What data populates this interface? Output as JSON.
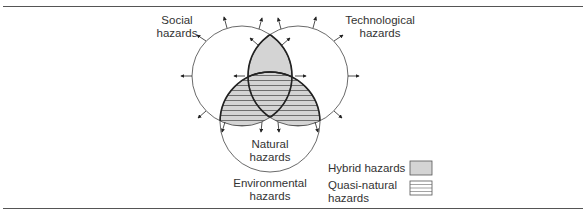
{
  "diagram": {
    "type": "venn",
    "sets": [
      {
        "id": "social",
        "label_line1": "Social",
        "label_line2": "hazards"
      },
      {
        "id": "technological",
        "label_line1": "Technological",
        "label_line2": "hazards"
      },
      {
        "id": "environmental",
        "label_line1": "Environmental",
        "label_line2": "hazards"
      }
    ],
    "inner_label": {
      "line1": "Natural",
      "line2": "hazards"
    },
    "legend": [
      {
        "label": "Hybrid hazards",
        "pattern": "solid-gray"
      },
      {
        "label_line1": "Quasi-natural",
        "label_line2": "hazards",
        "pattern": "horizontal-lines"
      }
    ],
    "colors": {
      "hybrid_fill": "#d4d4d4",
      "stroke": "#333333",
      "hatch": "#555555"
    }
  }
}
